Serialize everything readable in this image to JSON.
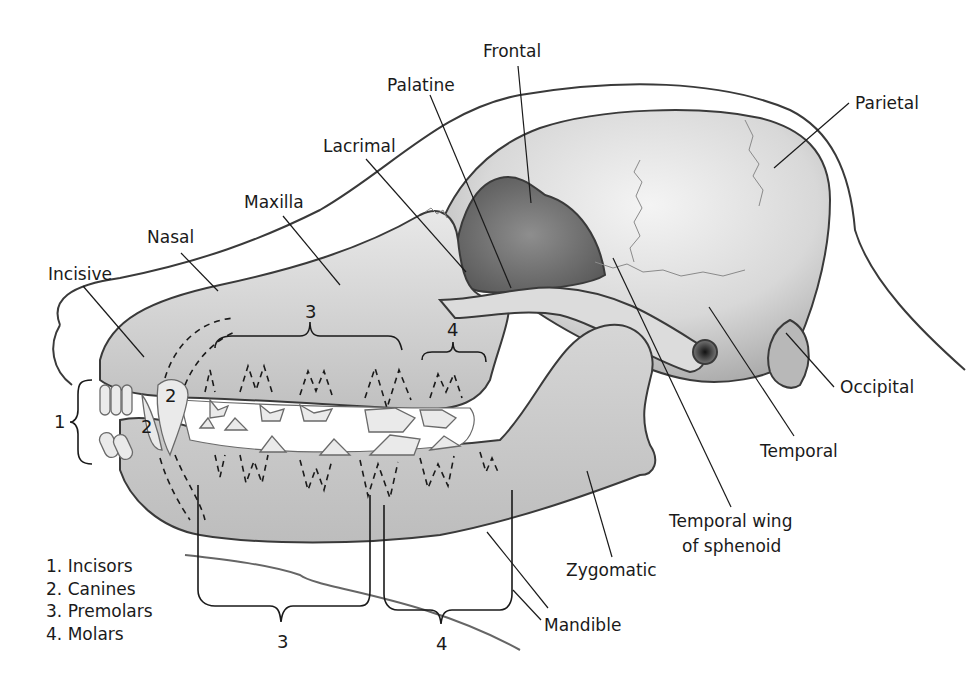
{
  "diagram": {
    "colors": {
      "ink": "#1a1a1a",
      "bone_light": "#e6e6e6",
      "bone_mid": "#c4c4c4",
      "bone_dark": "#7e7e7e",
      "background": "#ffffff"
    },
    "labels": {
      "frontal": "Frontal",
      "palatine": "Palatine",
      "parietal": "Parietal",
      "lacrimal": "Lacrimal",
      "maxilla": "Maxilla",
      "nasal": "Nasal",
      "incisive": "Incisive",
      "occipital": "Occipital",
      "temporal": "Temporal",
      "temporal_wing_line1": "Temporal wing",
      "temporal_wing_line2": "of sphenoid",
      "zygomatic": "Zygomatic",
      "mandible": "Mandible"
    },
    "tooth_group_numbers": {
      "upper_premolars": "3",
      "upper_molars": "4",
      "incisors": "1",
      "upper_canine": "2",
      "lower_canine": "2",
      "lower_premolars": "3",
      "lower_molars": "4"
    }
  },
  "legend": {
    "items": [
      {
        "number": "1.",
        "label": "Incisors"
      },
      {
        "number": "2.",
        "label": "Canines"
      },
      {
        "number": "3.",
        "label": "Premolars"
      },
      {
        "number": "4.",
        "label": "Molars"
      }
    ]
  }
}
